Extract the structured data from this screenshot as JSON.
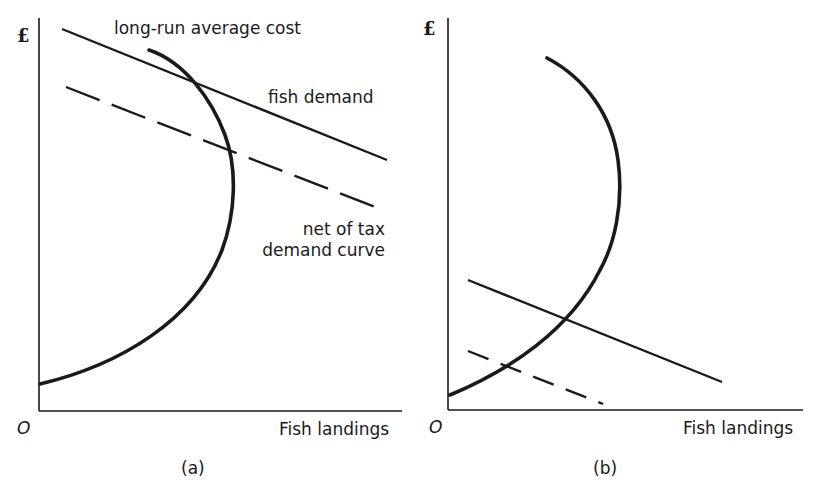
{
  "panels": [
    {
      "id": "a",
      "caption": "(a)",
      "y_axis_label": "£",
      "origin_label": "O",
      "x_axis_label": "Fish landings",
      "curves": {
        "lrac": "long-run average cost",
        "demand": "fish demand",
        "net_demand_line1": "net of tax",
        "net_demand_line2": "demand curve"
      }
    },
    {
      "id": "b",
      "caption": "(b)",
      "y_axis_label": "£",
      "origin_label": "O",
      "x_axis_label": "Fish landings"
    }
  ],
  "colors": {
    "ink": "#1a1a1a",
    "background": "#ffffff"
  }
}
